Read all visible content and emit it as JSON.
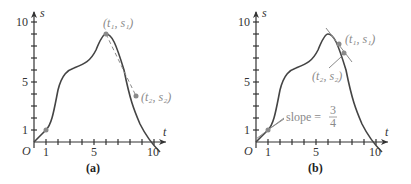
{
  "panels": [
    {
      "id": "a",
      "caption": "(a)",
      "axis": {
        "x_label": "t",
        "y_label": "s",
        "origin_label": "O",
        "x_ticks": [
          "1",
          "5",
          "10"
        ],
        "y_ticks": [
          "1",
          "5",
          "10"
        ]
      },
      "points": [
        {
          "label": "(t₁, s₁)",
          "t": 6,
          "s": 9
        },
        {
          "label": "(t₂, s₂)",
          "t": 8.5,
          "s": 3.8
        }
      ],
      "secant": true
    },
    {
      "id": "b",
      "caption": "(b)",
      "axis": {
        "x_label": "t",
        "y_label": "s",
        "origin_label": "O",
        "x_ticks": [
          "1",
          "5",
          "10"
        ],
        "y_ticks": [
          "1",
          "5",
          "10"
        ]
      },
      "points": [
        {
          "label": "(t₁, s₁)",
          "t": 7,
          "s": 8.2
        },
        {
          "label": "(t₂, s₂)",
          "t": 7.5,
          "s": 7.4
        }
      ],
      "slope_annotation": {
        "text": "slope =",
        "num": "3",
        "den": "4"
      }
    }
  ],
  "colors": {
    "curve": "#444444",
    "point": "#8a8a8a",
    "annot": "#8a8a8a"
  }
}
